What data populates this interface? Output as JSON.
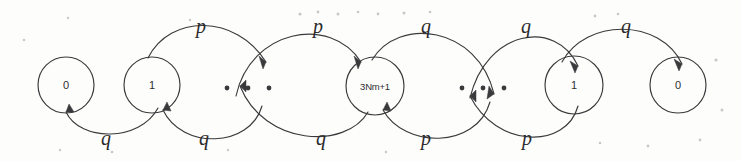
{
  "figure": {
    "kind": "state-transition-diagram",
    "background_color": "#fdfdfc",
    "ink_color": "#3a3a3c",
    "width": 741,
    "height": 161
  },
  "nodes": [
    {
      "id": "n0L",
      "label": "0",
      "cx": 66,
      "cy": 85,
      "r": 28
    },
    {
      "id": "n1L",
      "label": "1",
      "cx": 152,
      "cy": 85,
      "r": 28
    },
    {
      "id": "ellipsisL",
      "label": "· · ·",
      "cx": 248,
      "cy": 88,
      "r": 0
    },
    {
      "id": "nCenter",
      "label": "3Nm+1",
      "cx": 375,
      "cy": 86,
      "r": 29
    },
    {
      "id": "ellipsisR",
      "label": "· · ·",
      "cx": 483,
      "cy": 88,
      "r": 0
    },
    {
      "id": "n1R",
      "label": "1",
      "cx": 574,
      "cy": 85,
      "r": 29
    },
    {
      "id": "n0R",
      "label": "0",
      "cx": 678,
      "cy": 85,
      "r": 28
    }
  ],
  "ellipses": [
    {
      "id": "ellipsisL",
      "dots": [
        {
          "x": 227,
          "y": 88
        },
        {
          "x": 248,
          "y": 88
        },
        {
          "x": 269,
          "y": 88
        }
      ]
    },
    {
      "id": "ellipsisR",
      "dots": [
        {
          "x": 462,
          "y": 88
        },
        {
          "x": 483,
          "y": 88
        },
        {
          "x": 504,
          "y": 88
        }
      ]
    }
  ],
  "edge_labels": [
    {
      "id": "lbl-p-1",
      "text": "p",
      "x": 201,
      "y": 28,
      "position": "top"
    },
    {
      "id": "lbl-p-2",
      "text": "p",
      "x": 318,
      "y": 28,
      "position": "top"
    },
    {
      "id": "lbl-q-3",
      "text": "q",
      "x": 426,
      "y": 28,
      "position": "top"
    },
    {
      "id": "lbl-q-4",
      "text": "q",
      "x": 526,
      "y": 28,
      "position": "top"
    },
    {
      "id": "lbl-q-5",
      "text": "q",
      "x": 626,
      "y": 28,
      "position": "top"
    },
    {
      "id": "lbl-q-6",
      "text": "q",
      "x": 106,
      "y": 140,
      "position": "bottom"
    },
    {
      "id": "lbl-q-7",
      "text": "q",
      "x": 204,
      "y": 140,
      "position": "bottom"
    },
    {
      "id": "lbl-q-8",
      "text": "q",
      "x": 321,
      "y": 140,
      "position": "bottom"
    },
    {
      "id": "lbl-p-9",
      "text": "p",
      "x": 426,
      "y": 140,
      "position": "bottom"
    },
    {
      "id": "lbl-p-10",
      "text": "p",
      "x": 527,
      "y": 140,
      "position": "bottom"
    }
  ],
  "transitions": [
    {
      "id": "t-1L-to-ellL",
      "from": "n1L",
      "to": "ellipsisL",
      "probability": "p",
      "direction": "rightward",
      "arc": "top"
    },
    {
      "id": "t-ellL-to-C",
      "from": "ellipsisL",
      "to": "nCenter",
      "probability": "p",
      "direction": "rightward",
      "arc": "top"
    },
    {
      "id": "t-C-to-ellR",
      "from": "nCenter",
      "to": "ellipsisR",
      "probability": "q",
      "direction": "rightward",
      "arc": "top"
    },
    {
      "id": "t-ellR-to-1R",
      "from": "ellipsisR",
      "to": "n1R",
      "probability": "q",
      "direction": "rightward",
      "arc": "top"
    },
    {
      "id": "t-1R-to-0R",
      "from": "n1R",
      "to": "n0R",
      "probability": "q",
      "direction": "rightward",
      "arc": "top"
    },
    {
      "id": "t-1L-to-0L",
      "from": "n1L",
      "to": "n0L",
      "probability": "q",
      "direction": "leftward",
      "arc": "bottom"
    },
    {
      "id": "t-ellL-to-1L",
      "from": "ellipsisL",
      "to": "n1L",
      "probability": "q",
      "direction": "leftward",
      "arc": "bottom"
    },
    {
      "id": "t-C-to-ellL",
      "from": "nCenter",
      "to": "ellipsisL",
      "probability": "q",
      "direction": "leftward",
      "arc": "bottom"
    },
    {
      "id": "t-ellR-to-C",
      "from": "ellipsisR",
      "to": "nCenter",
      "probability": "p",
      "direction": "leftward",
      "arc": "bottom"
    },
    {
      "id": "t-1R-to-ellR",
      "from": "n1R",
      "to": "ellipsisR",
      "probability": "p",
      "direction": "leftward",
      "arc": "bottom"
    }
  ]
}
